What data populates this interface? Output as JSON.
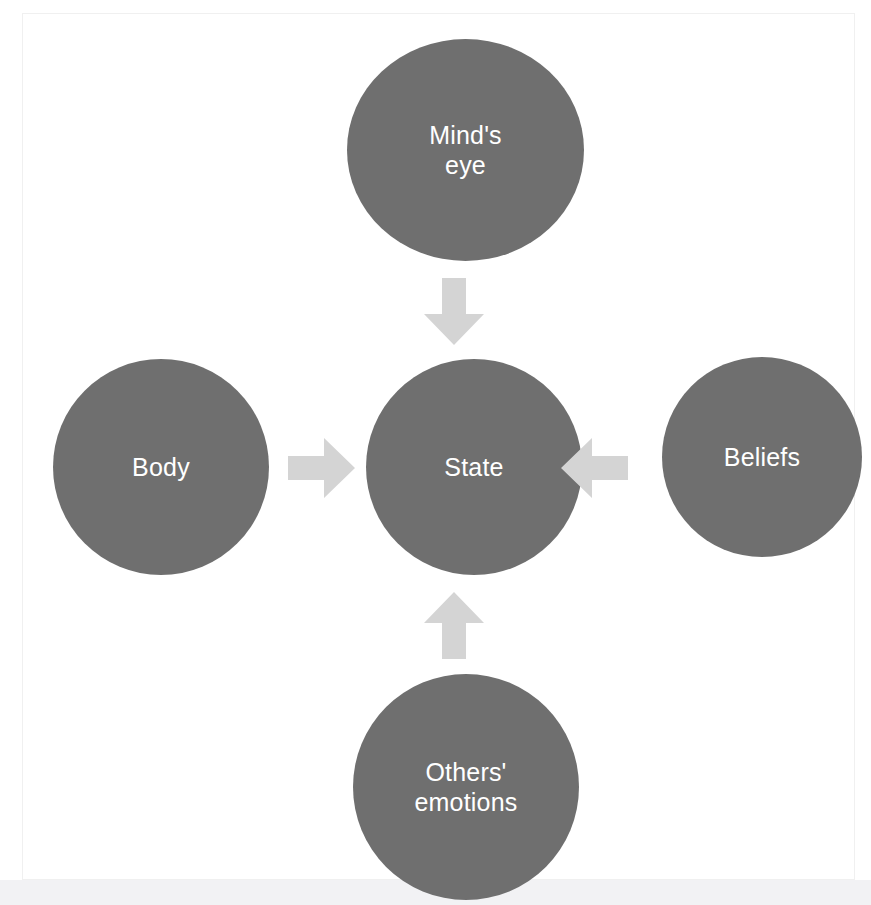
{
  "diagram": {
    "background_color": "#ffffff",
    "panel_color": "#ffffff",
    "page_strip_color": "#f2f2f4",
    "node_color": "#6f6f6f",
    "node_text_color": "#ffffff",
    "arrow_color": "#d4d4d4",
    "nodes": [
      {
        "id": "minds-eye",
        "label": "Mind's\neye",
        "position": "top"
      },
      {
        "id": "body",
        "label": "Body",
        "position": "left"
      },
      {
        "id": "state",
        "label": "State",
        "position": "center"
      },
      {
        "id": "beliefs",
        "label": "Beliefs",
        "position": "right"
      },
      {
        "id": "others-emotions",
        "label": "Others'\nemotions",
        "position": "bottom"
      }
    ],
    "arrows": [
      {
        "id": "minds-eye-to-state",
        "from": "minds-eye",
        "to": "state",
        "direction": "down"
      },
      {
        "id": "body-to-state",
        "from": "body",
        "to": "state",
        "direction": "right"
      },
      {
        "id": "beliefs-to-state",
        "from": "beliefs",
        "to": "state",
        "direction": "left"
      },
      {
        "id": "others-emotions-to-state",
        "from": "others-emotions",
        "to": "state",
        "direction": "up"
      }
    ]
  }
}
